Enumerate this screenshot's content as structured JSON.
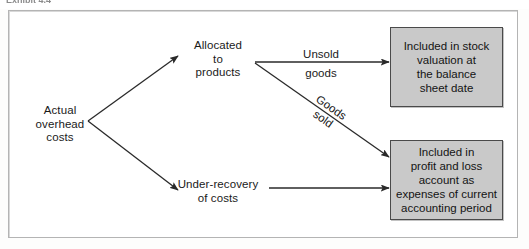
{
  "figure": {
    "caption_cropped": "Exhibit 4.4",
    "frame_border_color": "#b4b4b4",
    "background_color": "#ffffff"
  },
  "nodes": {
    "source": {
      "label": "Actual\noverhead\ncosts",
      "name": "actual-overhead-costs"
    },
    "allocated": {
      "label": "Allocated\nto\nproducts",
      "name": "allocated-to-products"
    },
    "under_recovery": {
      "label": "Under-recovery\nof costs",
      "name": "under-recovery-of-costs"
    }
  },
  "boxes": {
    "stock": {
      "label": "Included in stock\nvaluation at\nthe balance\nsheet date",
      "fill_color": "#c9c9c9",
      "border_color": "#4a4a4a"
    },
    "profit_loss": {
      "label": "Included in\nprofit and loss\naccount as\nexpenses of current\naccounting period",
      "fill_color": "#c9c9c9",
      "border_color": "#4a4a4a"
    }
  },
  "edge_labels": {
    "unsold_line1": "Unsold",
    "unsold_line2": "goods",
    "goods_sold": "Goods\nsold"
  },
  "arrows": [
    {
      "name": "source-to-allocated",
      "from": "Actual overhead costs",
      "to": "Allocated to products",
      "label": "",
      "color": "#2a2a2a"
    },
    {
      "name": "source-to-under-recovery",
      "from": "Actual overhead costs",
      "to": "Under-recovery of costs",
      "label": "",
      "color": "#2a2a2a"
    },
    {
      "name": "allocated-to-stock",
      "from": "Allocated to products",
      "to": "Included in stock valuation at the balance sheet date",
      "label": "Unsold goods",
      "color": "#2a2a2a"
    },
    {
      "name": "allocated-to-profit-loss",
      "from": "Allocated to products",
      "to": "Included in profit and loss account as expenses of current accounting period",
      "label": "Goods sold",
      "color": "#2a2a2a"
    },
    {
      "name": "under-recovery-to-profit-loss",
      "from": "Under-recovery of costs",
      "to": "Included in profit and loss account as expenses of current accounting period",
      "label": "",
      "color": "#2a2a2a"
    }
  ]
}
